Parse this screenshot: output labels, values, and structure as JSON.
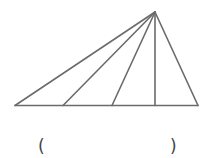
{
  "diagram": {
    "stroke_color": "#6b6b6b",
    "segments_from_apex": 3
  },
  "answer": {
    "open_paren": "(",
    "close_paren": ")",
    "blank": ""
  }
}
